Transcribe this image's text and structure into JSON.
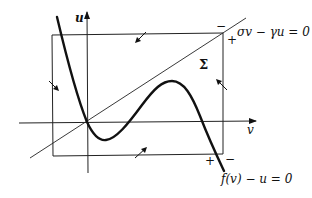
{
  "diagram": {
    "title": "",
    "axes": {
      "horizontal_label": "v",
      "vertical_label": "u"
    },
    "region_label": "Σ",
    "curves": [
      {
        "id": "nullcline-cubic",
        "equation": "f(v) − u = 0"
      },
      {
        "id": "nullcline-line",
        "equation": "σv − γu = 0"
      }
    ],
    "sign_labels": {
      "top_right_minus": "−",
      "top_right_plus": "+",
      "bottom_right_plus": "+",
      "bottom_right_minus": "−"
    },
    "boundary_arrows": [
      {
        "edge": "top",
        "direction": "inward (down-left)"
      },
      {
        "edge": "left",
        "direction": "inward (down-right)"
      },
      {
        "edge": "right",
        "direction": "inward (up-left)"
      },
      {
        "edge": "bottom",
        "direction": "inward (up-right)"
      }
    ],
    "colors": {
      "ink": "#111111",
      "background": "#ffffff"
    }
  }
}
